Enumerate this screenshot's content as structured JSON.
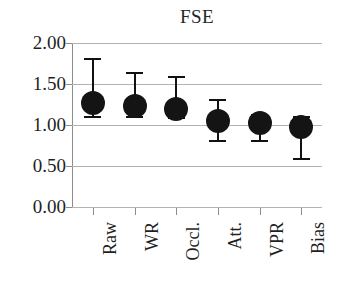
{
  "chart_data": {
    "type": "scatter",
    "title": "FSE",
    "xlabel": "",
    "ylabel": "",
    "ylim": [
      0.0,
      2.0
    ],
    "yticks": [
      "0.00",
      "0.50",
      "1.00",
      "1.50",
      "2.00"
    ],
    "ytick_values": [
      0.0,
      0.5,
      1.0,
      1.5,
      2.0
    ],
    "grid": "horizontal",
    "legend": "none",
    "marker": "filled-circle",
    "marker_color": "#141414",
    "gridline_color": "#b3b3b3",
    "axis_color": "#8c8c8c",
    "categories": [
      "Raw",
      "WR",
      "Occl.",
      "Att.",
      "VPR",
      "Bias"
    ],
    "values": [
      1.27,
      1.23,
      1.2,
      1.05,
      1.03,
      0.97
    ],
    "error_low": [
      1.1,
      1.1,
      1.08,
      0.8,
      0.8,
      0.58
    ],
    "error_high": [
      1.8,
      1.63,
      1.58,
      1.3,
      1.12,
      1.1
    ],
    "series": [
      {
        "name": "FSE",
        "points": [
          {
            "category": "Raw",
            "value": 1.27,
            "low": 1.1,
            "high": 1.8
          },
          {
            "category": "WR",
            "value": 1.23,
            "low": 1.1,
            "high": 1.63
          },
          {
            "category": "Occl.",
            "value": 1.2,
            "low": 1.08,
            "high": 1.58
          },
          {
            "category": "Att.",
            "value": 1.05,
            "low": 0.8,
            "high": 1.3
          },
          {
            "category": "VPR",
            "value": 1.03,
            "low": 0.8,
            "high": 1.12
          },
          {
            "category": "Bias",
            "value": 0.97,
            "low": 0.58,
            "high": 1.1
          }
        ]
      }
    ]
  }
}
